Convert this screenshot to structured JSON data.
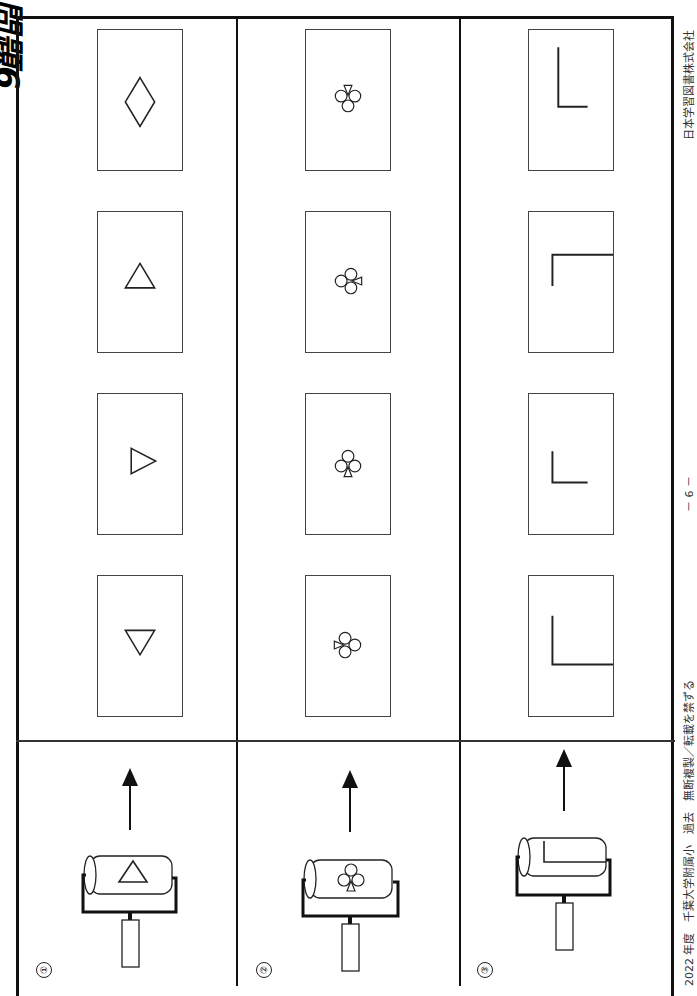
{
  "page": {
    "title": "問題6",
    "page_number": "－ 6 －",
    "footer_left": "2022 年度　千葉大学附属小　過去　無断複製／転載を禁ずる",
    "footer_right": "日本学習図書株式会社"
  },
  "questions": [
    {
      "number": "①",
      "roller_shape": "triangle-up",
      "options": [
        "triangle-down",
        "triangle-right",
        "triangle-up",
        "diamond"
      ]
    },
    {
      "number": "②",
      "roller_shape": "club-upright",
      "options": [
        "club-rotated-left",
        "club-upright",
        "club-rotated-right",
        "club-inverted"
      ]
    },
    {
      "number": "③",
      "roller_shape": "corner-bracket",
      "options": [
        "corner-bracket-wide",
        "corner-l-small",
        "corner-bracket-top",
        "corner-l-large"
      ]
    }
  ]
}
